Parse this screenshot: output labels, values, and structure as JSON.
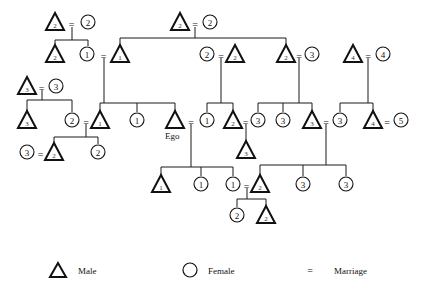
{
  "diagram": {
    "type": "kinship-chart",
    "ego_label": "Ego",
    "nodes": [
      {
        "id": "a1",
        "sex": "male",
        "n": "2",
        "x": 55,
        "y": 22
      },
      {
        "id": "a2",
        "sex": "female",
        "n": "2",
        "x": 88,
        "y": 22
      },
      {
        "id": "b1",
        "sex": "male",
        "n": "2",
        "x": 180,
        "y": 22
      },
      {
        "id": "b2",
        "sex": "female",
        "n": "2",
        "x": 210,
        "y": 22
      },
      {
        "id": "c1",
        "sex": "male",
        "n": "2",
        "x": 55,
        "y": 54
      },
      {
        "id": "c2",
        "sex": "female",
        "n": "1",
        "x": 87,
        "y": 54
      },
      {
        "id": "c3",
        "sex": "male",
        "n": "1",
        "x": 120,
        "y": 54
      },
      {
        "id": "c4",
        "sex": "female",
        "n": "2",
        "x": 207,
        "y": 54
      },
      {
        "id": "c5",
        "sex": "male",
        "n": "2",
        "x": 235,
        "y": 54
      },
      {
        "id": "c6",
        "sex": "male",
        "n": "2",
        "x": 286,
        "y": 54
      },
      {
        "id": "c7",
        "sex": "female",
        "n": "3",
        "x": 312,
        "y": 54
      },
      {
        "id": "c8",
        "sex": "male",
        "n": "4",
        "x": 353,
        "y": 54
      },
      {
        "id": "c9",
        "sex": "female",
        "n": "4",
        "x": 383,
        "y": 54
      },
      {
        "id": "d1",
        "sex": "male",
        "n": "3",
        "x": 27,
        "y": 86
      },
      {
        "id": "d2",
        "sex": "female",
        "n": "3",
        "x": 56,
        "y": 86
      },
      {
        "id": "e1",
        "sex": "male",
        "n": "3",
        "x": 27,
        "y": 120
      },
      {
        "id": "e2",
        "sex": "female",
        "n": "2",
        "x": 72,
        "y": 120
      },
      {
        "id": "e3",
        "sex": "male",
        "n": "1",
        "x": 100,
        "y": 120
      },
      {
        "id": "e4",
        "sex": "female",
        "n": "1",
        "x": 137,
        "y": 120
      },
      {
        "id": "ego",
        "sex": "male",
        "n": "",
        "x": 175,
        "y": 120
      },
      {
        "id": "e6",
        "sex": "female",
        "n": "1",
        "x": 207,
        "y": 120
      },
      {
        "id": "e7",
        "sex": "male",
        "n": "2",
        "x": 233,
        "y": 120
      },
      {
        "id": "e8",
        "sex": "female",
        "n": "3",
        "x": 258,
        "y": 120
      },
      {
        "id": "e9",
        "sex": "female",
        "n": "3",
        "x": 283,
        "y": 120
      },
      {
        "id": "e10",
        "sex": "male",
        "n": "3",
        "x": 312,
        "y": 120
      },
      {
        "id": "e11",
        "sex": "female",
        "n": "3",
        "x": 340,
        "y": 120
      },
      {
        "id": "e12",
        "sex": "male",
        "n": "4",
        "x": 373,
        "y": 120
      },
      {
        "id": "e13",
        "sex": "female",
        "n": "5",
        "x": 401,
        "y": 120
      },
      {
        "id": "f0",
        "sex": "male",
        "n": "3",
        "x": 246,
        "y": 150
      },
      {
        "id": "f1",
        "sex": "female",
        "n": "3",
        "x": 27,
        "y": 152
      },
      {
        "id": "f2",
        "sex": "male",
        "n": "2",
        "x": 54,
        "y": 152
      },
      {
        "id": "f3",
        "sex": "female",
        "n": "2",
        "x": 98,
        "y": 152
      },
      {
        "id": "g1",
        "sex": "male",
        "n": "1",
        "x": 161,
        "y": 184
      },
      {
        "id": "g2",
        "sex": "female",
        "n": "1",
        "x": 201,
        "y": 184
      },
      {
        "id": "g3",
        "sex": "female",
        "n": "1",
        "x": 233,
        "y": 184
      },
      {
        "id": "g4",
        "sex": "male",
        "n": "2",
        "x": 260,
        "y": 184
      },
      {
        "id": "g5",
        "sex": "female",
        "n": "3",
        "x": 303,
        "y": 184
      },
      {
        "id": "g6",
        "sex": "female",
        "n": "3",
        "x": 346,
        "y": 184
      },
      {
        "id": "h1",
        "sex": "female",
        "n": "2",
        "x": 237,
        "y": 215
      },
      {
        "id": "h2",
        "sex": "male",
        "n": "2",
        "x": 266,
        "y": 215
      }
    ],
    "marriage_symbol": "="
  },
  "legend": {
    "male_label": "Male",
    "female_label": "Female",
    "marriage_symbol": "=",
    "marriage_label": "Marriage"
  }
}
